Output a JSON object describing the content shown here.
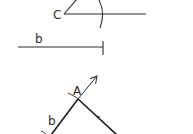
{
  "diagram": {
    "type": "geometric-construction",
    "stroke_color": "#2a2a2a",
    "background": "#ffffff",
    "top_figure": {
      "vertex_label": "C",
      "vertex": [
        64,
        14
      ],
      "ray_horizontal_end": [
        146,
        14
      ],
      "ray_diagonal_end": [
        76,
        0
      ],
      "arc": {
        "description": "construction arc centered at C crossing horizontal ray",
        "x": 102
      }
    },
    "segment": {
      "label": "b",
      "start": [
        18,
        47
      ],
      "end": [
        103,
        47
      ],
      "end_tick": true
    },
    "bottom_figure": {
      "vertex_label": "A",
      "side_label": "b",
      "vertex": [
        78,
        99
      ],
      "arrow_end": [
        97,
        76
      ],
      "left_line_end": [
        52,
        134
      ],
      "right_line_end": [
        116,
        134
      ]
    }
  }
}
